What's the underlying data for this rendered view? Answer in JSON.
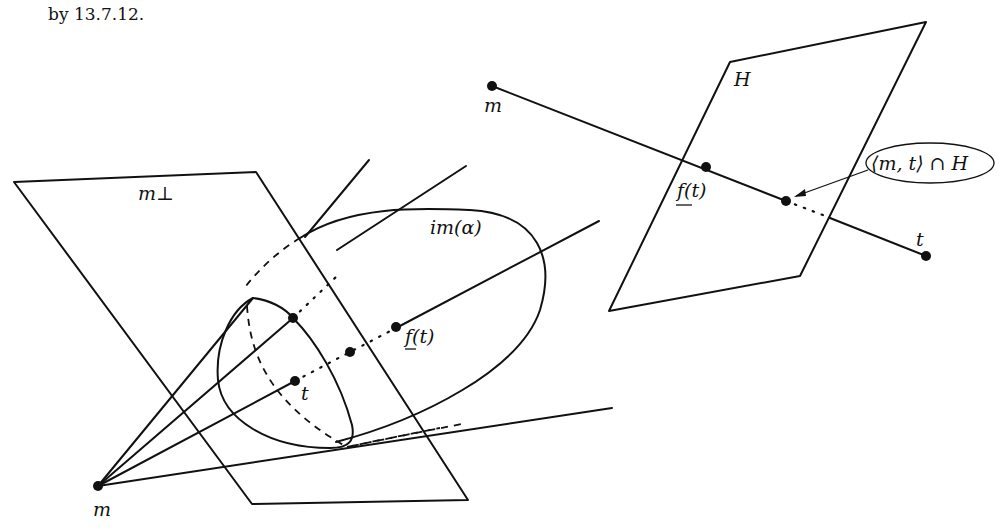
{
  "caption": "by 13.7.12.",
  "left_figure": {
    "plane_label": "m⊥",
    "surface_label": "im(α)",
    "point_labels": {
      "vertex": "m",
      "section_point": "t",
      "image_point": "f(t)"
    }
  },
  "right_figure": {
    "plane_label": "H",
    "point_labels": {
      "start": "m",
      "image_point": "f(t)",
      "end": "t"
    },
    "annotation": "⟨m, t⟩ ∩ H"
  }
}
